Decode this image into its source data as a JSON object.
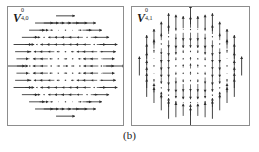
{
  "figure": {
    "caption": "(b)",
    "background_color": "#ffffff",
    "border_color": "#8d8d8d",
    "arrow_color": "#2b2b2b"
  },
  "panels": [
    {
      "id": "panel-left",
      "label_base": "V",
      "label_sup": "0",
      "label_sub": "4,0",
      "label_text": "V 0 4,0"
    },
    {
      "id": "panel-right",
      "label_base": "V",
      "label_sup": "0",
      "label_sub": "4,1",
      "label_text": "V 0 4,1"
    }
  ],
  "chart_data": [
    {
      "type": "quiver",
      "title": "V^0_{4,0}",
      "xlabel": "",
      "ylabel": "",
      "grid": false,
      "legend": "none",
      "domain": "unit disk",
      "xlim": [
        -1,
        1
      ],
      "ylim": [
        -1,
        1
      ],
      "grid_n": 15,
      "arrow_direction": "horizontal",
      "description": "Vector spherical harmonic V(0,4,0): arrows all aligned along the x-axis, magnitude varying radially with concentric nodal rings; arrows reverse sign across nodal circles.",
      "radial_profile_magnitudes": [
        1.0,
        0.45,
        0.1,
        0.55,
        0.95
      ],
      "sample_rows": [
        {
          "y": 0.866,
          "x": [
            -0.267,
            -0.133,
            0.0,
            0.133,
            0.267
          ],
          "u": [
            0.85,
            0.95,
            1.0,
            0.95,
            0.85
          ]
        },
        {
          "y": 0.733,
          "x": [
            -0.533,
            -0.4,
            -0.267,
            -0.133,
            0.0,
            0.133,
            0.267,
            0.4,
            0.533
          ],
          "u": [
            0.7,
            0.35,
            0.1,
            0.05,
            0.05,
            0.05,
            0.1,
            0.35,
            0.7
          ]
        },
        {
          "y": 0.6,
          "x": [
            -0.667,
            -0.533,
            -0.4,
            -0.267,
            -0.133,
            0.0,
            0.133,
            0.267,
            0.4,
            0.533,
            0.667
          ],
          "u": [
            0.9,
            0.5,
            0.15,
            0.1,
            0.1,
            0.12,
            0.1,
            0.15,
            0.5,
            0.9,
            0.95
          ]
        },
        {
          "y": 0.4,
          "x": [
            -0.8,
            -0.667,
            -0.533,
            -0.4,
            -0.267,
            -0.133,
            0.0,
            0.133,
            0.267,
            0.4,
            0.533,
            0.667,
            0.8
          ],
          "u": [
            1.0,
            0.6,
            0.2,
            0.1,
            0.25,
            0.4,
            0.45,
            0.4,
            0.25,
            0.1,
            0.2,
            0.6,
            1.0
          ]
        },
        {
          "y": 0.2,
          "x": [
            -0.867,
            -0.733,
            -0.6,
            -0.467,
            -0.333,
            -0.2,
            -0.067,
            0.067,
            0.2,
            0.333,
            0.467,
            0.6,
            0.733,
            0.867
          ],
          "u": [
            1.0,
            0.55,
            0.2,
            0.3,
            0.5,
            0.6,
            0.6,
            0.6,
            0.6,
            0.5,
            0.3,
            0.2,
            0.55,
            1.0
          ]
        },
        {
          "y": 0.0,
          "x": [
            -0.933,
            -0.8,
            -0.667,
            -0.533,
            -0.4,
            -0.267,
            -0.133,
            0.0,
            0.133,
            0.267,
            0.4,
            0.533,
            0.667,
            0.8,
            0.933
          ],
          "u": [
            1.0,
            0.5,
            0.15,
            0.35,
            0.6,
            0.7,
            0.72,
            0.72,
            0.72,
            0.7,
            0.6,
            0.35,
            0.15,
            0.5,
            1.0
          ]
        },
        {
          "y": -0.2,
          "x": [
            -0.867,
            -0.733,
            -0.6,
            -0.467,
            -0.333,
            -0.2,
            -0.067,
            0.067,
            0.2,
            0.333,
            0.467,
            0.6,
            0.733,
            0.867
          ],
          "u": [
            1.0,
            0.55,
            0.2,
            0.3,
            0.5,
            0.6,
            0.6,
            0.6,
            0.6,
            0.5,
            0.3,
            0.2,
            0.55,
            1.0
          ]
        },
        {
          "y": -0.4,
          "x": [
            -0.8,
            -0.667,
            -0.533,
            -0.4,
            -0.267,
            -0.133,
            0.0,
            0.133,
            0.267,
            0.4,
            0.533,
            0.667,
            0.8
          ],
          "u": [
            1.0,
            0.6,
            0.2,
            0.1,
            0.25,
            0.4,
            0.45,
            0.4,
            0.25,
            0.1,
            0.2,
            0.6,
            1.0
          ]
        },
        {
          "y": -0.6,
          "x": [
            -0.667,
            -0.533,
            -0.4,
            -0.267,
            -0.133,
            0.0,
            0.133,
            0.267,
            0.4,
            0.533,
            0.667
          ],
          "u": [
            0.9,
            0.5,
            0.15,
            0.1,
            0.1,
            0.12,
            0.1,
            0.15,
            0.5,
            0.9,
            0.95
          ]
        },
        {
          "y": -0.733,
          "x": [
            -0.533,
            -0.4,
            -0.267,
            -0.133,
            0.0,
            0.133,
            0.267,
            0.4,
            0.533
          ],
          "u": [
            0.7,
            0.35,
            0.1,
            0.05,
            0.05,
            0.05,
            0.1,
            0.35,
            0.7
          ]
        },
        {
          "y": -0.866,
          "x": [
            -0.267,
            -0.133,
            0.0,
            0.133,
            0.267
          ],
          "u": [
            0.85,
            0.95,
            1.0,
            0.95,
            0.85
          ]
        }
      ]
    },
    {
      "type": "quiver",
      "title": "V^0_{4,1}",
      "xlabel": "",
      "ylabel": "",
      "grid": false,
      "legend": "none",
      "domain": "unit disk",
      "xlim": [
        -1,
        1
      ],
      "ylim": [
        -1,
        1
      ],
      "grid_n": 15,
      "arrow_direction": "vertical",
      "description": "Vector spherical harmonic V(0,4,1): arrows all aligned along the y-axis, magnitude varying radially with concentric nodal rings; arrows reverse sign across nodal circles.",
      "radial_profile_magnitudes": [
        1.0,
        0.45,
        0.1,
        0.55,
        0.95
      ],
      "sample_rows": [
        {
          "y": 0.866,
          "x": [
            -0.267,
            -0.133,
            0.0,
            0.133,
            0.267
          ],
          "v": [
            0.85,
            0.95,
            1.0,
            0.95,
            0.85
          ]
        },
        {
          "y": 0.733,
          "x": [
            -0.533,
            -0.4,
            -0.267,
            -0.133,
            0.0,
            0.133,
            0.267,
            0.4,
            0.533
          ],
          "v": [
            0.7,
            0.35,
            0.1,
            0.05,
            0.05,
            0.05,
            0.1,
            0.35,
            0.7
          ]
        },
        {
          "y": 0.6,
          "x": [
            -0.667,
            -0.533,
            -0.4,
            -0.267,
            -0.133,
            0.0,
            0.133,
            0.267,
            0.4,
            0.533,
            0.667
          ],
          "v": [
            0.9,
            0.5,
            0.15,
            0.1,
            0.1,
            0.12,
            0.1,
            0.15,
            0.5,
            0.9,
            0.95
          ]
        },
        {
          "y": 0.4,
          "x": [
            -0.8,
            -0.667,
            -0.533,
            -0.4,
            -0.267,
            -0.133,
            0.0,
            0.133,
            0.267,
            0.4,
            0.533,
            0.667,
            0.8
          ],
          "v": [
            1.0,
            0.6,
            0.2,
            0.1,
            0.25,
            0.4,
            0.45,
            0.4,
            0.25,
            0.1,
            0.2,
            0.6,
            1.0
          ]
        },
        {
          "y": 0.2,
          "x": [
            -0.867,
            -0.733,
            -0.6,
            -0.467,
            -0.333,
            -0.2,
            -0.067,
            0.067,
            0.2,
            0.333,
            0.467,
            0.6,
            0.733,
            0.867
          ],
          "v": [
            1.0,
            0.55,
            0.2,
            0.3,
            0.5,
            0.6,
            0.6,
            0.6,
            0.6,
            0.5,
            0.3,
            0.2,
            0.55,
            1.0
          ]
        },
        {
          "y": 0.0,
          "x": [
            -0.933,
            -0.8,
            -0.667,
            -0.533,
            -0.4,
            -0.267,
            -0.133,
            0.0,
            0.133,
            0.267,
            0.4,
            0.533,
            0.667,
            0.8,
            0.933
          ],
          "v": [
            1.0,
            0.5,
            0.15,
            0.35,
            0.6,
            0.7,
            0.72,
            0.72,
            0.72,
            0.7,
            0.6,
            0.35,
            0.15,
            0.5,
            1.0
          ]
        },
        {
          "y": -0.2,
          "x": [
            -0.867,
            -0.733,
            -0.6,
            -0.467,
            -0.333,
            -0.2,
            -0.067,
            0.067,
            0.2,
            0.333,
            0.467,
            0.6,
            0.733,
            0.867
          ],
          "v": [
            1.0,
            0.55,
            0.2,
            0.3,
            0.5,
            0.6,
            0.6,
            0.6,
            0.6,
            0.5,
            0.3,
            0.2,
            0.55,
            1.0
          ]
        },
        {
          "y": -0.4,
          "x": [
            -0.8,
            -0.667,
            -0.533,
            -0.4,
            -0.267,
            -0.133,
            0.0,
            0.133,
            0.267,
            0.4,
            0.533,
            0.667,
            0.8
          ],
          "v": [
            1.0,
            0.6,
            0.2,
            0.1,
            0.25,
            0.4,
            0.45,
            0.4,
            0.25,
            0.1,
            0.2,
            0.6,
            1.0
          ]
        },
        {
          "y": -0.6,
          "x": [
            -0.667,
            -0.533,
            -0.4,
            -0.267,
            -0.133,
            0.0,
            0.133,
            0.267,
            0.4,
            0.533,
            0.667
          ],
          "v": [
            0.9,
            0.5,
            0.15,
            0.1,
            0.1,
            0.12,
            0.1,
            0.15,
            0.5,
            0.9,
            0.95
          ]
        },
        {
          "y": -0.733,
          "x": [
            -0.533,
            -0.4,
            -0.267,
            -0.133,
            0.0,
            0.133,
            0.267,
            0.4,
            0.533
          ],
          "v": [
            0.7,
            0.35,
            0.1,
            0.05,
            0.05,
            0.05,
            0.1,
            0.35,
            0.7
          ]
        },
        {
          "y": -0.866,
          "x": [
            -0.267,
            -0.133,
            0.0,
            0.133,
            0.267
          ],
          "v": [
            0.85,
            0.95,
            1.0,
            0.95,
            0.85
          ]
        }
      ]
    }
  ]
}
